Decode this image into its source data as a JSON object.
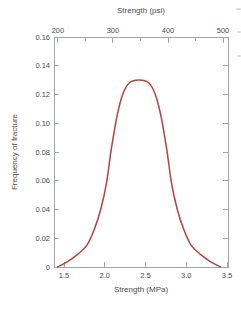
{
  "chart_data": {
    "type": "line",
    "title": "",
    "xlabel": "Strength (MPa)",
    "xlabel_secondary_top": "Strength (psi)",
    "ylabel": "Frequency of fracture",
    "grid": false,
    "legend": null,
    "axes": {
      "mpa": {
        "range": [
          1.377,
          3.512
        ],
        "ticks": [
          {
            "value": 1.5,
            "label": "1.5"
          },
          {
            "value": 2.0,
            "label": "2.0"
          },
          {
            "value": 2.5,
            "label": "2.5"
          },
          {
            "value": 3.0,
            "label": "3.0"
          },
          {
            "value": 3.5,
            "label": "3.5"
          }
        ]
      },
      "psi": {
        "range": [
          193,
          509
        ],
        "major_ticks": [
          {
            "value": 200,
            "label": "200"
          },
          {
            "value": 300,
            "label": "300"
          },
          {
            "value": 400,
            "label": "400"
          },
          {
            "value": 500,
            "label": "500"
          }
        ],
        "minor_ticks": [
          250,
          350,
          450
        ]
      },
      "freq": {
        "range": [
          0,
          0.16
        ],
        "ticks": [
          {
            "value": 0.0,
            "label": "0"
          },
          {
            "value": 0.02,
            "label": "0.02"
          },
          {
            "value": 0.04,
            "label": "0.04"
          },
          {
            "value": 0.06,
            "label": "0.06"
          },
          {
            "value": 0.08,
            "label": "0.08"
          },
          {
            "value": 0.1,
            "label": "0.10"
          },
          {
            "value": 0.12,
            "label": "0.12"
          },
          {
            "value": 0.14,
            "label": "0.14"
          },
          {
            "value": 0.16,
            "label": "0.16"
          }
        ]
      }
    },
    "series": [
      {
        "name": "fracture-strength-distribution",
        "color": "#b5413f",
        "points": [
          [
            1.42,
            0.0
          ],
          [
            1.55,
            0.004
          ],
          [
            1.67,
            0.009
          ],
          [
            1.78,
            0.015
          ],
          [
            1.87,
            0.026
          ],
          [
            1.95,
            0.04
          ],
          [
            2.02,
            0.058
          ],
          [
            2.08,
            0.082
          ],
          [
            2.15,
            0.105
          ],
          [
            2.22,
            0.12
          ],
          [
            2.3,
            0.128
          ],
          [
            2.42,
            0.13
          ],
          [
            2.54,
            0.128
          ],
          [
            2.62,
            0.12
          ],
          [
            2.69,
            0.105
          ],
          [
            2.76,
            0.082
          ],
          [
            2.82,
            0.058
          ],
          [
            2.89,
            0.04
          ],
          [
            2.97,
            0.026
          ],
          [
            3.06,
            0.015
          ],
          [
            3.17,
            0.009
          ],
          [
            3.29,
            0.004
          ],
          [
            3.42,
            0.0
          ]
        ]
      }
    ],
    "summary": {
      "peak_mpa": 2.42,
      "peak_frequency": 0.13,
      "curve_zero_left_mpa": 1.42,
      "curve_zero_right_mpa": 3.42
    }
  }
}
